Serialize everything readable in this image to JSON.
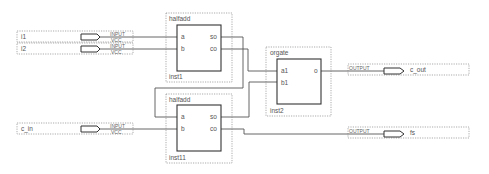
{
  "diagram": {
    "type": "schematic",
    "inputs": [
      {
        "name": "i1",
        "type_label": "INPUT",
        "default_label": "VCC"
      },
      {
        "name": "i2",
        "type_label": "INPUT",
        "default_label": "VCC"
      },
      {
        "name": "c_in",
        "type_label": "INPUT",
        "default_label": "VCC"
      }
    ],
    "outputs": [
      {
        "name": "c_out",
        "type_label": "OUTPUT"
      },
      {
        "name": "fs",
        "type_label": "OUTPUT"
      }
    ],
    "blocks": [
      {
        "type": "halfadd",
        "instance": "inst1",
        "ports_in": [
          "a",
          "b"
        ],
        "ports_out": [
          "so",
          "co"
        ]
      },
      {
        "type": "halfadd",
        "instance": "inst11",
        "ports_in": [
          "a",
          "b"
        ],
        "ports_out": [
          "so",
          "co"
        ]
      },
      {
        "type": "orgate",
        "instance": "inst2",
        "ports_in": [
          "a1",
          "b1"
        ],
        "ports_out": [
          "o"
        ]
      }
    ],
    "connections": [
      {
        "from": "i1",
        "to": "inst1.a"
      },
      {
        "from": "i2",
        "to": "inst1.b"
      },
      {
        "from": "inst1.so",
        "to": "inst11.a"
      },
      {
        "from": "inst1.co",
        "to": "inst2.a1"
      },
      {
        "from": "c_in",
        "to": "inst11.b"
      },
      {
        "from": "inst11.so",
        "to": "inst2.b1"
      },
      {
        "from": "inst2.o",
        "to": "c_out"
      },
      {
        "from": "inst11.co",
        "to": "fs"
      }
    ]
  }
}
